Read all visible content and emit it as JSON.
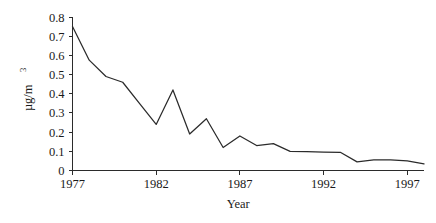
{
  "chart_data": {
    "type": "line",
    "title": "",
    "xlabel": "Year",
    "ylabel": "µg/m",
    "ylabel_superscript": "3",
    "xlim": [
      1977,
      1998
    ],
    "ylim": [
      0,
      0.8
    ],
    "grid": false,
    "legend": false,
    "x": [
      1977,
      1978,
      1979,
      1980,
      1981,
      1982,
      1983,
      1984,
      1985,
      1986,
      1987,
      1988,
      1989,
      1990,
      1991,
      1992,
      1993,
      1994,
      1995,
      1996,
      1997,
      1998
    ],
    "values": [
      0.75,
      0.575,
      0.49,
      0.46,
      0.35,
      0.24,
      0.42,
      0.19,
      0.27,
      0.12,
      0.18,
      0.13,
      0.14,
      0.1,
      0.098,
      0.096,
      0.095,
      0.045,
      0.055,
      0.055,
      0.05,
      0.035
    ],
    "series": [
      {
        "name": "concentration",
        "values": [
          0.75,
          0.575,
          0.49,
          0.46,
          0.35,
          0.24,
          0.42,
          0.19,
          0.27,
          0.12,
          0.18,
          0.13,
          0.14,
          0.1,
          0.098,
          0.096,
          0.095,
          0.045,
          0.055,
          0.055,
          0.05,
          0.035
        ]
      }
    ],
    "x_tick_labels": [
      "1977",
      "1982",
      "1987",
      "1992",
      "1997"
    ],
    "x_tick_values": [
      1977,
      1982,
      1987,
      1992,
      1997
    ],
    "y_tick_labels": [
      "0",
      "0.1",
      "0.2",
      "0.3",
      "0.4",
      "0.5",
      "0.6",
      "0.7",
      "0.8"
    ],
    "y_tick_values": [
      0,
      0.1,
      0.2,
      0.3,
      0.4,
      0.5,
      0.6,
      0.7,
      0.8
    ],
    "line_color": "#2b2b2b",
    "axis_color": "#2b2b2b",
    "background_color": "#ffffff"
  }
}
